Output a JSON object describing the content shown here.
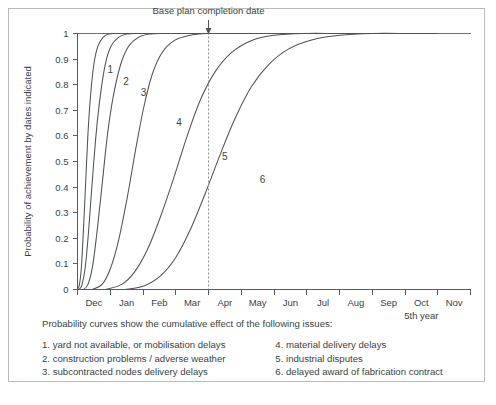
{
  "chart_data": {
    "type": "line",
    "title": "",
    "xlabel": "",
    "ylabel": "Probability of achievement by dates indicated",
    "ylim": [
      0,
      1
    ],
    "ytick_labels": [
      "0",
      "0.1",
      "0.2",
      "0.3",
      "0.4",
      "0.5",
      "0.6",
      "0.7",
      "0.8",
      "0.9",
      "1"
    ],
    "ytick_values": [
      0,
      0.1,
      0.2,
      0.3,
      0.4,
      0.5,
      0.6,
      0.7,
      0.8,
      0.9,
      1
    ],
    "categories": [
      "Dec",
      "Jan",
      "Feb",
      "Mar",
      "Apr",
      "May",
      "Jun",
      "Jul",
      "Aug",
      "Sep",
      "Oct",
      "Nov"
    ],
    "x_axis_note": "5th year",
    "grid": false,
    "legend_position": "inline-curve-labels",
    "annotations": [
      {
        "name": "base-plan-completion-date",
        "text": "Base plan completion date",
        "x_category": "Apr",
        "x_boundary": "Mar/Apr",
        "style": "vertical-dotted-line-with-down-arrow"
      }
    ],
    "series": [
      {
        "name": "1",
        "label": "1",
        "description": "yard not available, or mobilisation delays",
        "points": [
          [
            0.0,
            0.0
          ],
          [
            0.06,
            0.02
          ],
          [
            0.12,
            0.09
          ],
          [
            0.18,
            0.23
          ],
          [
            0.25,
            0.42
          ],
          [
            0.32,
            0.61
          ],
          [
            0.4,
            0.76
          ],
          [
            0.5,
            0.88
          ],
          [
            0.62,
            0.95
          ],
          [
            0.78,
            0.985
          ],
          [
            0.95,
            0.998
          ],
          [
            1.2,
            1.0
          ],
          [
            2.0,
            1.0
          ],
          [
            11.0,
            1.0
          ]
        ]
      },
      {
        "name": "2",
        "label": "2",
        "description": "construction problems / adverse weather",
        "points": [
          [
            0.05,
            0.0
          ],
          [
            0.14,
            0.02
          ],
          [
            0.24,
            0.09
          ],
          [
            0.34,
            0.23
          ],
          [
            0.45,
            0.42
          ],
          [
            0.57,
            0.61
          ],
          [
            0.7,
            0.76
          ],
          [
            0.85,
            0.88
          ],
          [
            1.02,
            0.95
          ],
          [
            1.25,
            0.985
          ],
          [
            1.5,
            0.998
          ],
          [
            1.85,
            1.0
          ],
          [
            2.6,
            1.0
          ],
          [
            11.0,
            1.0
          ]
        ]
      },
      {
        "name": "3",
        "label": "3",
        "description": "subcontracted nodes delivery delays",
        "points": [
          [
            0.18,
            0.0
          ],
          [
            0.32,
            0.02
          ],
          [
            0.46,
            0.09
          ],
          [
            0.6,
            0.23
          ],
          [
            0.76,
            0.42
          ],
          [
            0.92,
            0.61
          ],
          [
            1.1,
            0.76
          ],
          [
            1.32,
            0.88
          ],
          [
            1.56,
            0.95
          ],
          [
            1.86,
            0.985
          ],
          [
            2.2,
            0.998
          ],
          [
            2.65,
            1.0
          ],
          [
            3.4,
            1.0
          ],
          [
            11.0,
            1.0
          ]
        ]
      },
      {
        "name": "4",
        "label": "4",
        "description": "material delivery delays",
        "points": [
          [
            0.45,
            0.0
          ],
          [
            0.75,
            0.02
          ],
          [
            1.0,
            0.08
          ],
          [
            1.25,
            0.19
          ],
          [
            1.52,
            0.36
          ],
          [
            1.78,
            0.55
          ],
          [
            2.02,
            0.71
          ],
          [
            2.28,
            0.84
          ],
          [
            2.58,
            0.925
          ],
          [
            2.95,
            0.972
          ],
          [
            3.4,
            0.992
          ],
          [
            3.95,
            1.0
          ],
          [
            4.8,
            1.0
          ],
          [
            11.0,
            1.0
          ]
        ]
      },
      {
        "name": "5",
        "label": "5",
        "description": "industrial disputes",
        "points": [
          [
            0.85,
            0.0
          ],
          [
            1.35,
            0.02
          ],
          [
            1.75,
            0.07
          ],
          [
            2.15,
            0.16
          ],
          [
            2.55,
            0.29
          ],
          [
            2.95,
            0.44
          ],
          [
            3.35,
            0.6
          ],
          [
            3.75,
            0.74
          ],
          [
            4.2,
            0.85
          ],
          [
            4.7,
            0.925
          ],
          [
            5.3,
            0.972
          ],
          [
            6.0,
            0.993
          ],
          [
            6.9,
            1.0
          ],
          [
            8.2,
            1.0
          ],
          [
            11.0,
            1.0
          ]
        ]
      },
      {
        "name": "6",
        "label": "6",
        "description": "delayed award of fabrication contract",
        "points": [
          [
            1.45,
            0.0
          ],
          [
            2.05,
            0.015
          ],
          [
            2.55,
            0.055
          ],
          [
            3.0,
            0.125
          ],
          [
            3.45,
            0.235
          ],
          [
            3.9,
            0.375
          ],
          [
            4.35,
            0.525
          ],
          [
            4.8,
            0.665
          ],
          [
            5.3,
            0.79
          ],
          [
            5.85,
            0.88
          ],
          [
            6.45,
            0.94
          ],
          [
            7.15,
            0.975
          ],
          [
            8.0,
            0.993
          ],
          [
            9.0,
            1.0
          ],
          [
            10.2,
            1.0
          ],
          [
            11.0,
            1.0
          ]
        ]
      }
    ],
    "curve_label_positions": [
      {
        "label": "1",
        "x": 1.0,
        "y": 0.845
      },
      {
        "label": "2",
        "x": 1.48,
        "y": 0.8
      },
      {
        "label": "3",
        "x": 2.02,
        "y": 0.757
      },
      {
        "label": "4",
        "x": 3.1,
        "y": 0.64
      },
      {
        "label": "5",
        "x": 4.5,
        "y": 0.505
      },
      {
        "label": "6",
        "x": 5.65,
        "y": 0.415
      }
    ]
  },
  "legend": {
    "intro": "Probability curves show the cumulative effect of the following issues:",
    "left_column": [
      "1. yard not available, or mobilisation delays",
      "2. construction problems / adverse weather",
      "3. subcontracted nodes delivery delays"
    ],
    "right_column": [
      "4. material delivery delays",
      "5. industrial disputes",
      "6. delayed award of fabrication contract"
    ]
  },
  "colors": {
    "curve": "#4d5358",
    "axis": "#555a5e",
    "marker": "#8e8e8e",
    "frame": "#b9b9b9",
    "text": "#3a3f43",
    "background": "#ffffff"
  }
}
